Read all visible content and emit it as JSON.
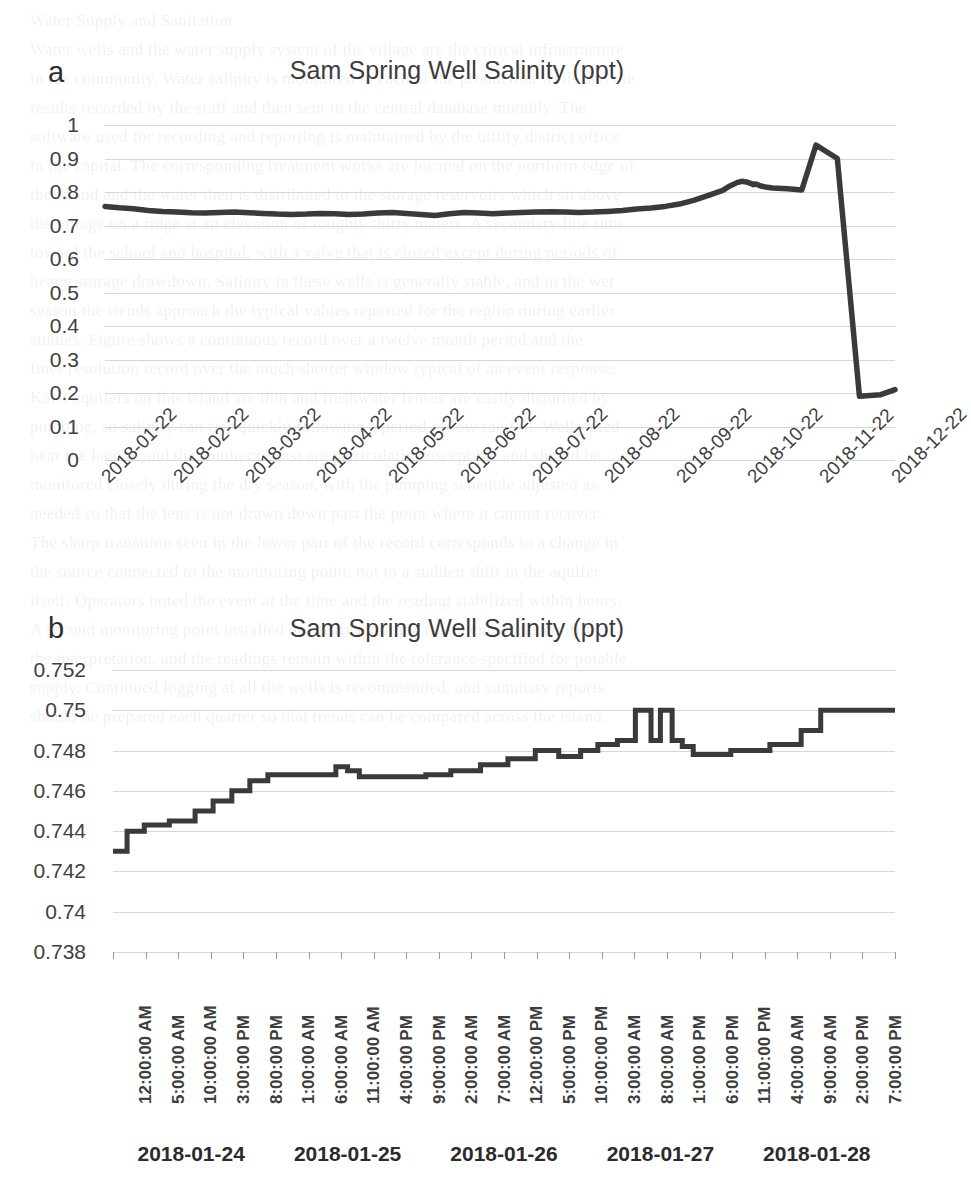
{
  "page": {
    "background": "#ffffff",
    "line_color": "#3a3a3a",
    "grid_color": "#d6d6d6",
    "text_color": "#3b3b3b"
  },
  "panel_a": {
    "letter": "a",
    "title": "Sam Spring Well Salinity (ppt)",
    "ytick_labels": [
      "1",
      "0.9",
      "0.8",
      "0.7",
      "0.6",
      "0.5",
      "0.4",
      "0.3",
      "0.2",
      "0.1",
      "0"
    ],
    "xtick_labels": [
      "2018-01-22",
      "2018-02-22",
      "2018-03-22",
      "2018-04-22",
      "2018-05-22",
      "2018-06-22",
      "2018-07-22",
      "2018-08-22",
      "2018-09-22",
      "2018-10-22",
      "2018-11-22",
      "2018-12-22"
    ]
  },
  "panel_b": {
    "letter": "b",
    "title": "Sam Spring Well Salinity (ppt)",
    "ytick_labels": [
      "0.752",
      "0.75",
      "0.748",
      "0.746",
      "0.744",
      "0.742",
      "0.74",
      "0.738"
    ],
    "xtick_labels": [
      "12:00:00 AM",
      "5:00:00 AM",
      "10:00:00 AM",
      "3:00:00 PM",
      "8:00:00 PM",
      "1:00:00 AM",
      "6:00:00 AM",
      "11:00:00 AM",
      "4:00:00 PM",
      "9:00:00 PM",
      "2:00:00 AM",
      "7:00:00 AM",
      "12:00:00 PM",
      "5:00:00 PM",
      "10:00:00 PM",
      "3:00:00 AM",
      "8:00:00 AM",
      "1:00:00 PM",
      "6:00:00 PM",
      "11:00:00 PM",
      "4:00:00 AM",
      "9:00:00 AM",
      "2:00:00 PM",
      "7:00:00 PM"
    ],
    "day_labels": [
      "2018-01-24",
      "2018-01-25",
      "2018-01-26",
      "2018-01-27",
      "2018-01-28"
    ]
  },
  "chart_data": [
    {
      "type": "line",
      "panel": "a",
      "title": "Sam Spring Well Salinity (ppt)",
      "xlabel": "",
      "ylabel": "",
      "ylim": [
        0,
        1
      ],
      "ytick_step": 0.1,
      "grid": true,
      "legend": "none",
      "x_type": "date",
      "x_tick_labels": [
        "2018-01-22",
        "2018-02-22",
        "2018-03-22",
        "2018-04-22",
        "2018-05-22",
        "2018-06-22",
        "2018-07-22",
        "2018-08-22",
        "2018-09-22",
        "2018-10-22",
        "2018-11-22",
        "2018-12-22"
      ],
      "annotations": [
        "Salinity holds near 0.73-0.76 ppt from January through July",
        "Gradual rise to about 0.83 ppt in late August",
        "Sharp spike to about 0.94 ppt in mid November",
        "Abrupt drop to about 0.19 ppt, slowly recovering to 0.21 ppt by late December"
      ],
      "x": [
        0.0,
        0.018,
        0.036,
        0.055,
        0.073,
        0.091,
        0.109,
        0.127,
        0.145,
        0.164,
        0.182,
        0.2,
        0.218,
        0.236,
        0.255,
        0.273,
        0.291,
        0.309,
        0.327,
        0.345,
        0.364,
        0.382,
        0.4,
        0.418,
        0.436,
        0.455,
        0.473,
        0.491,
        0.509,
        0.527,
        0.545,
        0.564,
        0.582,
        0.6,
        0.618,
        0.636,
        0.655,
        0.673,
        0.691,
        0.709,
        0.727,
        0.745,
        0.764,
        0.782,
        0.791,
        0.8,
        0.806,
        0.812,
        0.818,
        0.821,
        0.824,
        0.827,
        0.83,
        0.836,
        0.845,
        0.864,
        0.882,
        0.9,
        0.927,
        0.955,
        0.982,
        1.0
      ],
      "y": [
        0.757,
        0.753,
        0.75,
        0.745,
        0.742,
        0.74,
        0.738,
        0.737,
        0.739,
        0.74,
        0.738,
        0.736,
        0.734,
        0.733,
        0.734,
        0.736,
        0.735,
        0.733,
        0.734,
        0.737,
        0.739,
        0.736,
        0.733,
        0.73,
        0.735,
        0.739,
        0.737,
        0.735,
        0.737,
        0.739,
        0.74,
        0.741,
        0.74,
        0.739,
        0.74,
        0.742,
        0.745,
        0.749,
        0.752,
        0.757,
        0.764,
        0.775,
        0.79,
        0.805,
        0.818,
        0.828,
        0.832,
        0.83,
        0.825,
        0.822,
        0.824,
        0.821,
        0.818,
        0.815,
        0.812,
        0.81,
        0.806,
        0.94,
        0.9,
        0.19,
        0.195,
        0.21
      ]
    },
    {
      "type": "line",
      "panel": "b",
      "title": "Sam Spring Well Salinity (ppt)",
      "xlabel": "",
      "ylabel": "",
      "ylim": [
        0.738,
        0.752
      ],
      "ytick_step": 0.002,
      "grid": true,
      "legend": "none",
      "x_type": "datetime",
      "step_plot": true,
      "x_tick_labels": [
        "12:00:00 AM",
        "5:00:00 AM",
        "10:00:00 AM",
        "3:00:00 PM",
        "8:00:00 PM",
        "1:00:00 AM",
        "6:00:00 AM",
        "11:00:00 AM",
        "4:00:00 PM",
        "9:00:00 PM",
        "2:00:00 AM",
        "7:00:00 AM",
        "12:00:00 PM",
        "5:00:00 PM",
        "10:00:00 PM",
        "3:00:00 AM",
        "8:00:00 AM",
        "1:00:00 PM",
        "6:00:00 PM",
        "11:00:00 PM",
        "4:00:00 AM",
        "9:00:00 AM",
        "2:00:00 PM",
        "7:00:00 PM"
      ],
      "day_group_labels": [
        "2018-01-24",
        "2018-01-25",
        "2018-01-26",
        "2018-01-27",
        "2018-01-28"
      ],
      "annotations": [
        "Quantized step series rising from 0.743 ppt to 0.750 ppt over five days",
        "Two single-sample spikes to 0.750 ppt on 2018-01-27",
        "Final plateau at 0.750 ppt on 2018-01-28"
      ],
      "x": [
        0.0,
        0.018,
        0.018,
        0.04,
        0.04,
        0.072,
        0.072,
        0.105,
        0.105,
        0.128,
        0.128,
        0.152,
        0.152,
        0.175,
        0.175,
        0.198,
        0.198,
        0.285,
        0.285,
        0.3,
        0.3,
        0.315,
        0.315,
        0.4,
        0.4,
        0.432,
        0.432,
        0.47,
        0.47,
        0.505,
        0.505,
        0.54,
        0.54,
        0.57,
        0.57,
        0.598,
        0.598,
        0.62,
        0.62,
        0.645,
        0.645,
        0.668,
        0.668,
        0.688,
        0.688,
        0.7,
        0.7,
        0.715,
        0.715,
        0.728,
        0.728,
        0.742,
        0.742,
        0.79,
        0.79,
        0.84,
        0.84,
        0.88,
        0.88,
        0.905,
        0.905,
        0.93,
        0.93,
        1.0
      ],
      "y": [
        0.743,
        0.743,
        0.744,
        0.744,
        0.7443,
        0.7443,
        0.7445,
        0.7445,
        0.745,
        0.745,
        0.7455,
        0.7455,
        0.746,
        0.746,
        0.7465,
        0.7465,
        0.7468,
        0.7468,
        0.7472,
        0.7472,
        0.747,
        0.747,
        0.7467,
        0.7467,
        0.7468,
        0.7468,
        0.747,
        0.747,
        0.7473,
        0.7473,
        0.7476,
        0.7476,
        0.748,
        0.748,
        0.7477,
        0.7477,
        0.748,
        0.748,
        0.7483,
        0.7483,
        0.7485,
        0.7485,
        0.75,
        0.75,
        0.7485,
        0.7485,
        0.75,
        0.75,
        0.7485,
        0.7485,
        0.7482,
        0.7482,
        0.7478,
        0.7478,
        0.748,
        0.748,
        0.7483,
        0.7483,
        0.749,
        0.749,
        0.75,
        0.75,
        0.75,
        0.75
      ]
    }
  ]
}
